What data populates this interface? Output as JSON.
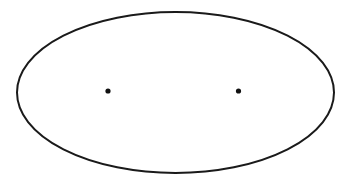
{
  "canvas": {
    "width": 354,
    "height": 184,
    "background": "#ffffff"
  },
  "ellipse": {
    "cx": 175.5,
    "cy": 92.5,
    "rx": 158.5,
    "ry": 80.5,
    "stroke": "#1a1a1a",
    "stroke_width": 2,
    "fill": "none"
  },
  "foci": [
    {
      "label": "focus-left",
      "cx": 108,
      "cy": 91,
      "r": 2.6,
      "fill": "#111111"
    },
    {
      "label": "focus-right",
      "cx": 238.5,
      "cy": 91,
      "r": 2.6,
      "fill": "#111111"
    }
  ]
}
